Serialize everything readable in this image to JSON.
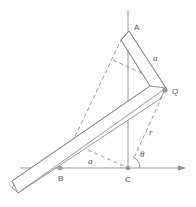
{
  "diagram": {
    "colors": {
      "line": "#8a8a8a",
      "point": "#9a9a9a",
      "text": "#555555"
    },
    "labels": {
      "A": "A",
      "Q": "Q",
      "B": "B",
      "C": "C",
      "a_top": "a",
      "a_bottom": "a",
      "r": "r",
      "theta": "θ"
    },
    "points": {
      "B": [
        60,
        168
      ],
      "C": [
        128,
        168
      ],
      "Q": [
        165,
        90
      ]
    }
  }
}
